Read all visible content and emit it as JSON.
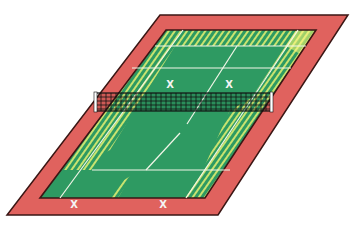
{
  "diagram": {
    "type": "tennis-court-perspective",
    "colors": {
      "background": "#ffffff",
      "surround": "#e0625e",
      "surround_border": "#3a1614",
      "court": "#2e9a62",
      "hatch": "#c9e36f",
      "lines": "#f2f6e8",
      "net_mesh": "#111111",
      "net_post": "#ffffff"
    },
    "markers": {
      "top_left": "X",
      "top_right": "X",
      "bottom_left": "X",
      "bottom_right": "X"
    }
  }
}
